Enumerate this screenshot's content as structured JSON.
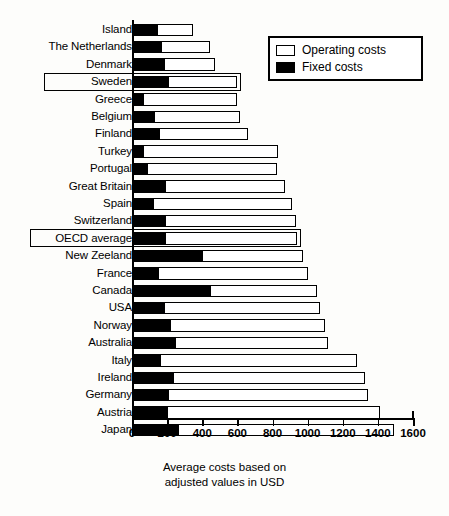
{
  "chart_data": {
    "type": "bar",
    "orientation": "horizontal",
    "stacked": true,
    "title": "",
    "xlabel": "Average costs based on adjusted values in USD",
    "ylabel": "",
    "xlim": [
      0,
      1600
    ],
    "xticks": [
      0,
      200,
      400,
      600,
      800,
      1000,
      1200,
      1400,
      1600
    ],
    "grid": false,
    "legend_position": "top-right",
    "categories": [
      "Island",
      "The Netherlands",
      "Denmark",
      "Sweden",
      "Greece",
      "Belgium",
      "Finland",
      "Turkey",
      "Portugal",
      "Great Britain",
      "Spain",
      "Switzerland",
      "OECD average",
      "New Zeeland",
      "France",
      "Canada",
      "USA",
      "Norway",
      "Australia",
      "Italy",
      "Ireland",
      "Germany",
      "Austria",
      "Japan"
    ],
    "series": [
      {
        "name": "Fixed costs",
        "color": "#000000",
        "values": [
          140,
          165,
          185,
          205,
          65,
          125,
          155,
          60,
          85,
          190,
          120,
          190,
          190,
          400,
          150,
          445,
          180,
          215,
          245,
          160,
          235,
          205,
          200,
          260
        ]
      },
      {
        "name": "Operating costs",
        "color": "#ffffff",
        "values": [
          210,
          280,
          285,
          395,
          535,
          490,
          505,
          770,
          740,
          680,
          790,
          745,
          750,
          575,
          850,
          610,
          890,
          885,
          870,
          1120,
          1090,
          1140,
          1210,
          1230
        ]
      }
    ],
    "totals": [
      350,
      445,
      470,
      600,
      600,
      615,
      660,
      830,
      825,
      870,
      910,
      935,
      940,
      975,
      1000,
      1055,
      1070,
      1100,
      1115,
      1280,
      1325,
      1345,
      1410,
      1490
    ],
    "highlighted_categories": [
      "Sweden",
      "OECD average"
    ],
    "annotations": []
  },
  "legend": {
    "items": [
      {
        "label": "Operating costs",
        "swatch": "open-square-icon"
      },
      {
        "label": "Fixed costs",
        "swatch": "filled-square-icon"
      }
    ]
  },
  "axis_title": {
    "line1": "Average costs based on",
    "line2": "adjusted values in USD"
  }
}
